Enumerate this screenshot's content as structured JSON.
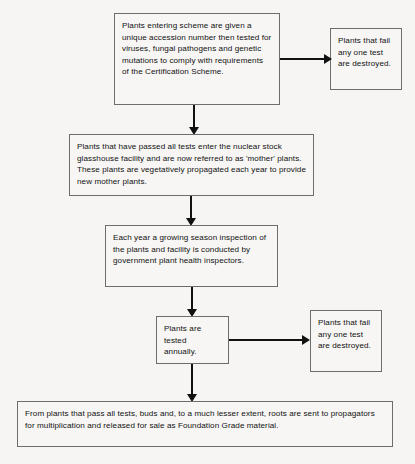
{
  "diagram": {
    "background_color": "#f6f5f3",
    "box_border_color": "#6d6d6d",
    "box_fill_color": "#f7f6f4",
    "arrow_color": "#111111",
    "text_color": "#111111"
  },
  "nodes": {
    "entry": {
      "label": "Plants entering scheme are given a unique accession number then tested for viruses, fungal pathogens and genetic mutations to comply with requirements of the Certification Scheme."
    },
    "fail_top": {
      "label": "Plants that fail any one test are destroyed."
    },
    "mother_stock": {
      "label": "Plants that have passed all tests enter the nuclear stock glasshouse facility and are now referred to as 'mother' plants. These plants are vegetatively propagated each year to provide new mother plants."
    },
    "inspection": {
      "label": "Each year a growing season inspection of the plants and facility is conducted by government plant health inspectors."
    },
    "annual_test": {
      "label": "Plants are tested annually."
    },
    "fail_bottom": {
      "label": "Plants that fail any one test are destroyed."
    },
    "foundation": {
      "label": "From plants that pass all tests, buds and, to a much lesser extent, roots are sent to propagators for multiplication and released for sale as Foundation Grade material."
    }
  },
  "edges": [
    {
      "name": "entry-to-fail-top",
      "direction": "right"
    },
    {
      "name": "entry-to-mother-stock",
      "direction": "down"
    },
    {
      "name": "mother-stock-to-inspection",
      "direction": "down"
    },
    {
      "name": "inspection-to-annual-test",
      "direction": "down"
    },
    {
      "name": "annual-test-to-fail-bottom",
      "direction": "right"
    },
    {
      "name": "annual-test-to-foundation",
      "direction": "down"
    }
  ]
}
